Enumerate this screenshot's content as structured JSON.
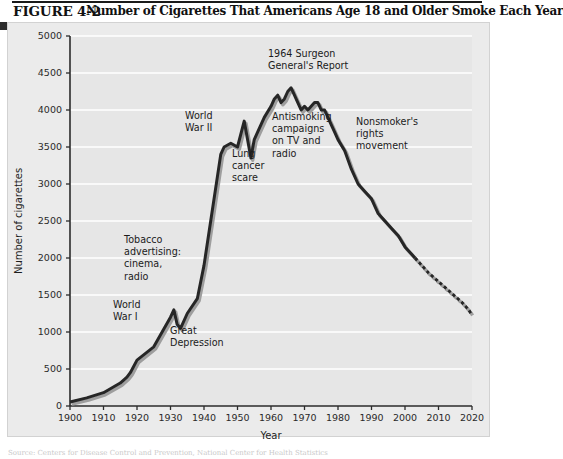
{
  "figure": {
    "number": "FIGURE 4-2",
    "title": "Number of Cigarettes That Americans Age 18 and Older Smoke Each Year",
    "bottom_caption": "Source: Centers for Disease Control and Prevention, National Center for Health Statistics"
  },
  "colors": {
    "panel_background": "#ebebeb",
    "plot_background": "#e6e6e6",
    "gridline": "#ffffff",
    "axis": "#2b2b2b",
    "series_line": "#262626",
    "series_shadow": "#9e9e9e",
    "title_text": "#111111"
  },
  "chart_data": {
    "type": "line",
    "title": "Number of Cigarettes That Americans Age 18 and Older Smoke Each Year",
    "xlabel": "Year",
    "ylabel": "Number of cigarettes",
    "xlim": [
      1900,
      2020
    ],
    "ylim": [
      0,
      5000
    ],
    "xticks": [
      1900,
      1910,
      1920,
      1930,
      1940,
      1950,
      1960,
      1970,
      1980,
      1990,
      2000,
      2010,
      2020
    ],
    "yticks": [
      0,
      500,
      1000,
      1500,
      2000,
      2500,
      3000,
      3500,
      4000,
      4500,
      5000
    ],
    "grid": "horizontal",
    "legend": "none",
    "series": [
      {
        "name": "Cigarettes per adult per year",
        "style": "solid",
        "x": [
          1900,
          1905,
          1910,
          1915,
          1917,
          1918,
          1920,
          1925,
          1930,
          1931,
          1932,
          1933,
          1935,
          1938,
          1940,
          1942,
          1944,
          1945,
          1946,
          1948,
          1950,
          1952,
          1953,
          1954,
          1955,
          1956,
          1958,
          1960,
          1961,
          1962,
          1963,
          1964,
          1965,
          1966,
          1967,
          1968,
          1969,
          1970,
          1971,
          1972,
          1973,
          1974,
          1975,
          1976,
          1977,
          1978,
          1979,
          1980,
          1982,
          1984,
          1986,
          1988,
          1990,
          1992,
          1994,
          1996,
          1998,
          2000,
          2002,
          2003
        ],
        "y": [
          54,
          110,
          180,
          310,
          390,
          450,
          620,
          800,
          1200,
          1300,
          1100,
          1050,
          1250,
          1450,
          1900,
          2500,
          3100,
          3400,
          3500,
          3550,
          3500,
          3850,
          3600,
          3350,
          3600,
          3700,
          3900,
          4050,
          4150,
          4200,
          4100,
          4150,
          4250,
          4300,
          4200,
          4100,
          4000,
          4050,
          4000,
          4050,
          4100,
          4100,
          4000,
          4000,
          3900,
          3800,
          3700,
          3600,
          3450,
          3200,
          3000,
          2900,
          2800,
          2600,
          2500,
          2400,
          2300,
          2150,
          2050,
          2000
        ]
      },
      {
        "name": "Projected",
        "style": "dashed",
        "x": [
          2003,
          2005,
          2007,
          2009,
          2011,
          2013,
          2015,
          2017,
          2019,
          2020
        ],
        "y": [
          2000,
          1900,
          1800,
          1720,
          1640,
          1560,
          1480,
          1400,
          1300,
          1230
        ]
      }
    ],
    "annotations": [
      {
        "text": [
          "World",
          "War I"
        ],
        "x_px": 113,
        "y_px": 308
      },
      {
        "text": [
          "Tobacco",
          "advertising:",
          "cinema,",
          "radio"
        ],
        "x_px": 124,
        "y_px": 243
      },
      {
        "text": [
          "Great",
          "Depression"
        ],
        "x_px": 170,
        "y_px": 334
      },
      {
        "text": [
          "World",
          "War II"
        ],
        "x_px": 185,
        "y_px": 119
      },
      {
        "text": [
          "Lung",
          "cancer",
          "scare"
        ],
        "x_px": 232,
        "y_px": 157
      },
      {
        "text": [
          "Antismoking",
          "campaigns",
          "on TV and",
          "radio"
        ],
        "x_px": 272,
        "y_px": 120
      },
      {
        "text": [
          "1964 Surgeon",
          "General's Report"
        ],
        "x_px": 268,
        "y_px": 57
      },
      {
        "text": [
          "Nonsmoker's",
          "rights",
          "movement"
        ],
        "x_px": 356,
        "y_px": 125
      }
    ]
  }
}
